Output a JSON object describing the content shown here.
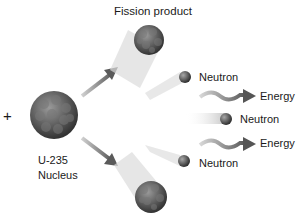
{
  "diagram": {
    "title_label": "Fission product",
    "plus_sign": "+",
    "nucleus": {
      "line1": "U-235",
      "line2": "Nucleus"
    },
    "neutrons": [
      {
        "label": "Neutron"
      },
      {
        "label": "Neutron"
      },
      {
        "label": "Neutron"
      }
    ],
    "energies": [
      {
        "label": "Energy"
      },
      {
        "label": "Energy"
      }
    ],
    "colors": {
      "nucleus": "#5a5a5a",
      "arrow": "#6e6e6e",
      "trail": "#d8d8d8",
      "text": "#1a1a1a"
    }
  }
}
